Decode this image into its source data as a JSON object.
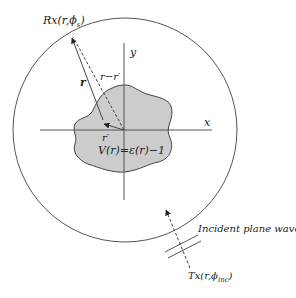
{
  "diagram": {
    "type": "inverse-scattering-geometry",
    "labels": {
      "receiver": "Rx(r,ϕ",
      "receiver_sub": "s",
      "receiver_close": ")",
      "y_axis": "y",
      "x_axis": "x",
      "r_vector": "r",
      "r_minus_rprime": "r−r′",
      "r_prime": "r′",
      "potential": "V(r)=ε(r)−1",
      "incident_wave": "Incident plane wave",
      "transmitter": "Tx(r,ϕ",
      "transmitter_sub": "inc",
      "transmitter_close": ")"
    },
    "colors": {
      "line": "#555555",
      "scatterer_fill": "#cccccc",
      "text": "#222222"
    },
    "circle": {
      "cx": 125,
      "cy": 130,
      "r": 112
    },
    "origin": {
      "x": 124,
      "y": 130
    }
  }
}
